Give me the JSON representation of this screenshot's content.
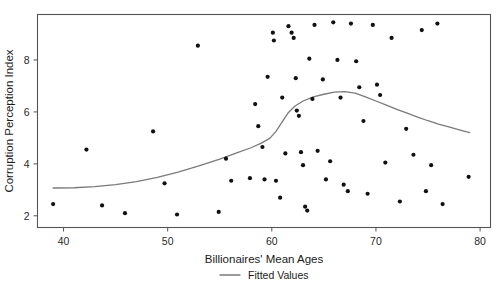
{
  "chart_data": {
    "type": "scatter",
    "title": "",
    "xlabel": "Billionaires' Mean Ages",
    "ylabel": "Corruption Perception Index",
    "xlim": [
      37.5,
      81.0
    ],
    "ylim": [
      1.55,
      9.75
    ],
    "xticks": [
      40,
      50,
      60,
      70,
      80
    ],
    "yticks": [
      2,
      4,
      6,
      8
    ],
    "xtick_labels": [
      "40",
      "50",
      "60",
      "70",
      "80"
    ],
    "ytick_labels": [
      "2",
      "4",
      "6",
      "8"
    ],
    "grid": false,
    "legend_position": "bottom-center",
    "legend": [
      {
        "name": "Fitted Values",
        "marker": "line",
        "color": "#7a7a7a"
      }
    ],
    "point_color": "#111111",
    "point_radius": 2.1,
    "frame_color": "#555555",
    "series": [
      {
        "name": "Countries",
        "type": "scatter",
        "points": [
          [
            39.0,
            2.45
          ],
          [
            42.2,
            4.55
          ],
          [
            43.7,
            2.4
          ],
          [
            45.9,
            2.1
          ],
          [
            48.6,
            5.25
          ],
          [
            49.7,
            3.25
          ],
          [
            50.9,
            2.05
          ],
          [
            52.9,
            8.55
          ],
          [
            54.9,
            2.15
          ],
          [
            55.6,
            4.2
          ],
          [
            56.1,
            3.35
          ],
          [
            57.9,
            3.45
          ],
          [
            58.4,
            6.3
          ],
          [
            58.7,
            5.45
          ],
          [
            59.1,
            4.65
          ],
          [
            59.3,
            3.4
          ],
          [
            59.6,
            7.35
          ],
          [
            60.1,
            9.05
          ],
          [
            60.2,
            8.75
          ],
          [
            60.4,
            3.35
          ],
          [
            60.8,
            2.7
          ],
          [
            61.0,
            6.55
          ],
          [
            61.3,
            4.4
          ],
          [
            61.6,
            9.3
          ],
          [
            61.9,
            9.05
          ],
          [
            62.1,
            8.85
          ],
          [
            62.3,
            7.3
          ],
          [
            62.4,
            6.05
          ],
          [
            62.6,
            5.85
          ],
          [
            62.8,
            4.45
          ],
          [
            63.0,
            3.95
          ],
          [
            63.2,
            2.35
          ],
          [
            63.4,
            2.2
          ],
          [
            63.6,
            8.05
          ],
          [
            63.9,
            6.5
          ],
          [
            64.1,
            9.35
          ],
          [
            64.4,
            4.5
          ],
          [
            64.9,
            7.25
          ],
          [
            65.2,
            3.4
          ],
          [
            65.6,
            4.1
          ],
          [
            65.9,
            9.45
          ],
          [
            66.3,
            8.0
          ],
          [
            66.6,
            6.55
          ],
          [
            66.9,
            3.2
          ],
          [
            67.3,
            2.95
          ],
          [
            67.6,
            9.4
          ],
          [
            68.1,
            7.95
          ],
          [
            68.4,
            6.95
          ],
          [
            68.8,
            5.65
          ],
          [
            69.2,
            2.85
          ],
          [
            69.7,
            9.35
          ],
          [
            70.1,
            7.05
          ],
          [
            70.4,
            6.65
          ],
          [
            70.9,
            4.05
          ],
          [
            71.5,
            8.85
          ],
          [
            72.3,
            2.55
          ],
          [
            72.9,
            5.35
          ],
          [
            73.6,
            4.35
          ],
          [
            74.4,
            9.15
          ],
          [
            74.8,
            2.95
          ],
          [
            75.3,
            3.95
          ],
          [
            75.9,
            9.4
          ],
          [
            76.4,
            2.45
          ],
          [
            78.9,
            3.5
          ]
        ]
      },
      {
        "name": "Fitted Values",
        "type": "line",
        "points": [
          [
            39.0,
            3.07
          ],
          [
            41.0,
            3.08
          ],
          [
            43.0,
            3.12
          ],
          [
            45.0,
            3.2
          ],
          [
            47.0,
            3.32
          ],
          [
            49.0,
            3.48
          ],
          [
            51.0,
            3.68
          ],
          [
            53.0,
            3.92
          ],
          [
            55.0,
            4.18
          ],
          [
            56.5,
            4.4
          ],
          [
            58.0,
            4.62
          ],
          [
            59.0,
            4.8
          ],
          [
            59.8,
            4.98
          ],
          [
            60.4,
            5.25
          ],
          [
            61.0,
            5.62
          ],
          [
            61.6,
            5.98
          ],
          [
            62.2,
            6.22
          ],
          [
            63.0,
            6.42
          ],
          [
            64.0,
            6.58
          ],
          [
            65.0,
            6.68
          ],
          [
            66.0,
            6.76
          ],
          [
            67.0,
            6.78
          ],
          [
            68.0,
            6.72
          ],
          [
            69.0,
            6.58
          ],
          [
            70.0,
            6.42
          ],
          [
            71.0,
            6.26
          ],
          [
            72.0,
            6.1
          ],
          [
            73.0,
            5.95
          ],
          [
            74.0,
            5.8
          ],
          [
            75.0,
            5.66
          ],
          [
            76.0,
            5.53
          ],
          [
            77.0,
            5.42
          ],
          [
            78.0,
            5.31
          ],
          [
            79.0,
            5.2
          ]
        ]
      }
    ]
  }
}
